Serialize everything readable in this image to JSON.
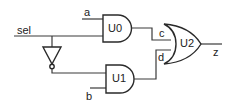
{
  "diagram": {
    "type": "logic-circuit",
    "signals": {
      "sel": "sel",
      "a": "a",
      "b": "b",
      "c": "c",
      "d": "d",
      "z": "z"
    },
    "gates": [
      {
        "id": "U0",
        "label": "U0",
        "kind": "AND",
        "inputs": [
          "a",
          "sel"
        ],
        "output": "c"
      },
      {
        "id": "U1",
        "label": "U1",
        "kind": "AND",
        "inputs": [
          "sel_n",
          "b"
        ],
        "output": "d"
      },
      {
        "id": "U2",
        "label": "U2",
        "kind": "OR",
        "inputs": [
          "c",
          "d"
        ],
        "output": "z"
      },
      {
        "id": "INV",
        "label": "",
        "kind": "NOT",
        "inputs": [
          "sel"
        ],
        "output": "sel_n"
      }
    ],
    "colors": {
      "wire": "#3a3a3a",
      "gate_stroke": "#2a2a2a",
      "background": "#ffffff"
    }
  }
}
